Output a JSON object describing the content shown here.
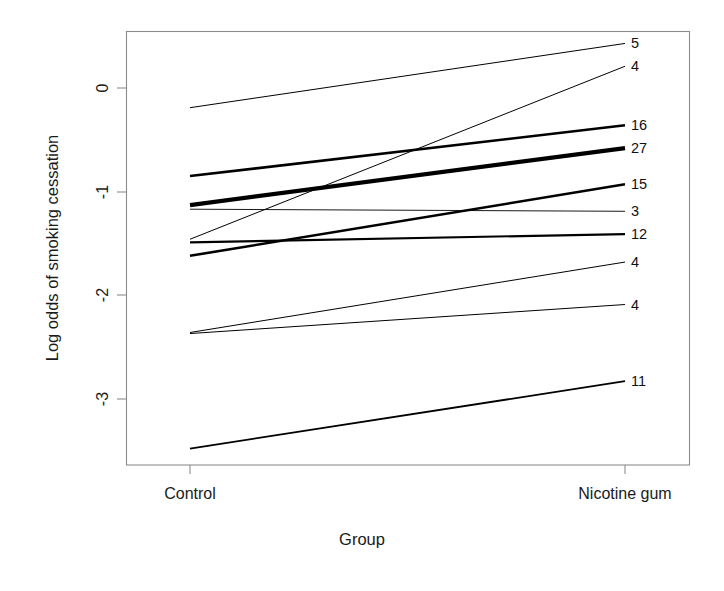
{
  "figure": {
    "background": "#ffffff",
    "frame_color": "#8c8c8c",
    "line_color": "#000000"
  },
  "axes": {
    "ylabel": "Log odds of smoking cessation",
    "xlabel": "Group",
    "y_ticks": [
      0,
      -1,
      -2,
      -3
    ],
    "y_tick_labels": [
      "0",
      "-1",
      "-2",
      "-3"
    ],
    "x_tick_labels": [
      "Control",
      "Nicotine gum"
    ]
  },
  "chart_data": {
    "type": "line",
    "title": "",
    "xlabel": "Group",
    "ylabel": "Log odds of smoking cessation",
    "categories": [
      "Control",
      "Nicotine gum"
    ],
    "x": [
      0,
      1
    ],
    "ylim": [
      -3.62,
      0.66
    ],
    "xlim": [
      -0.14,
      1.165
    ],
    "grid": false,
    "legend": "right-endpoint labels",
    "yticks": [
      0,
      -1,
      -2,
      -3
    ],
    "annotation_note": "Each line is one study; the right-hand number is the study size/weight and the line width is proportional to it.",
    "series": [
      {
        "name": "5",
        "label": "5",
        "values": [
          -0.19,
          0.43
        ],
        "linewidth": 1.0
      },
      {
        "name": "4a",
        "label": "4",
        "values": [
          -1.46,
          0.21
        ],
        "linewidth": 1.0
      },
      {
        "name": "16",
        "label": "16",
        "values": [
          -0.85,
          -0.36
        ],
        "linewidth": 2.6
      },
      {
        "name": "27",
        "label": "27",
        "values": [
          -1.13,
          -0.58
        ],
        "linewidth": 4.2
      },
      {
        "name": "15",
        "label": "15",
        "values": [
          -1.62,
          -0.93
        ],
        "linewidth": 2.5
      },
      {
        "name": "3",
        "label": "3",
        "values": [
          -1.17,
          -1.19
        ],
        "linewidth": 0.9
      },
      {
        "name": "12",
        "label": "12",
        "values": [
          -1.49,
          -1.41
        ],
        "linewidth": 2.2
      },
      {
        "name": "4b",
        "label": "4",
        "values": [
          -2.36,
          -1.68
        ],
        "linewidth": 1.0
      },
      {
        "name": "4c",
        "label": "4",
        "values": [
          -2.37,
          -2.09
        ],
        "linewidth": 1.0
      },
      {
        "name": "11",
        "label": "11",
        "values": [
          -3.48,
          -2.83
        ],
        "linewidth": 1.8
      }
    ]
  }
}
